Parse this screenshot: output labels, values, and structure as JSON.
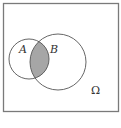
{
  "diagram": {
    "type": "venn",
    "universe_label": "Ω",
    "sets": [
      {
        "label": "A",
        "cx": 29,
        "cy": 59,
        "r": 20
      },
      {
        "label": "B",
        "cx": 58,
        "cy": 62,
        "r": 28
      }
    ],
    "shaded_region": "A ∩ B",
    "colors": {
      "stroke": "#555555",
      "shade": "#a6a6a6",
      "frame": "#7a7a7a",
      "background": "#ffffff"
    }
  }
}
